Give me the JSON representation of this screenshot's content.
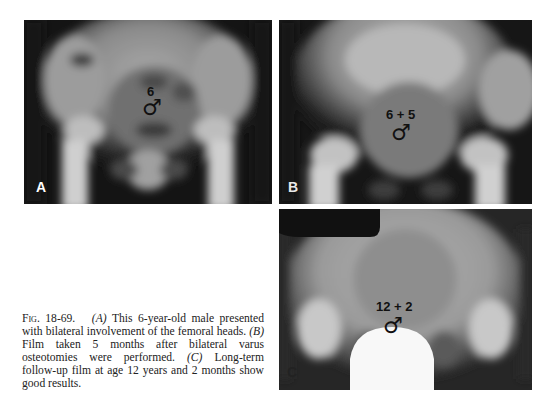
{
  "figure": {
    "panels": [
      {
        "letter": "A",
        "age_label": "6",
        "symbol": "♂"
      },
      {
        "letter": "B",
        "age_label": "6 + 5",
        "symbol": "♂"
      },
      {
        "letter": "C",
        "age_label": "12 + 2",
        "symbol": "♂"
      }
    ],
    "caption": {
      "label": "Fig. 18-69.",
      "a_ref": "(A)",
      "a_text": "This 6-year-old male presented with bilateral involvement of the femoral heads.",
      "b_ref": "(B)",
      "b_text": "Film taken 5 months after bilateral varus osteotomies were performed.",
      "c_ref": "(C)",
      "c_text": "Long-term follow-up film at age 12 years and 2 months show good results."
    }
  }
}
